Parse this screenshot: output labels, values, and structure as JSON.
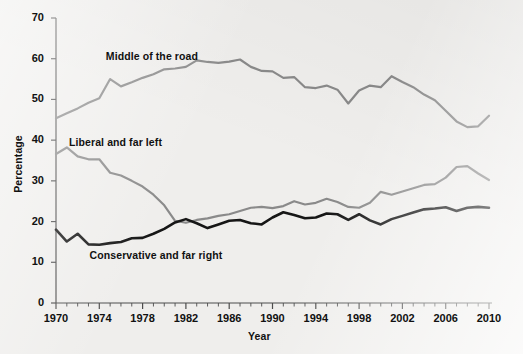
{
  "chart_data": {
    "type": "line",
    "title": "",
    "xlabel": "Year",
    "ylabel": "Percentage",
    "xlim": [
      1970,
      2010
    ],
    "ylim": [
      0,
      70
    ],
    "grid": false,
    "legend_position": "inline-annotations",
    "xticks": [
      1970,
      1974,
      1978,
      1982,
      1986,
      1990,
      1994,
      1998,
      2002,
      2006,
      2010
    ],
    "xtick_labels": [
      "1970",
      "1974",
      "1978",
      "1982",
      "1986",
      "1990",
      "1994",
      "1998",
      "2002",
      "2006",
      "2010"
    ],
    "yticks": [
      0,
      10,
      20,
      30,
      40,
      50,
      60,
      70
    ],
    "ytick_labels": [
      "0",
      "10",
      "20",
      "30",
      "40",
      "50",
      "60",
      "70"
    ],
    "x": [
      1970,
      1971,
      1972,
      1973,
      1974,
      1975,
      1976,
      1977,
      1978,
      1979,
      1980,
      1981,
      1982,
      1983,
      1984,
      1985,
      1986,
      1987,
      1988,
      1989,
      1990,
      1991,
      1992,
      1993,
      1994,
      1995,
      1996,
      1997,
      1998,
      1999,
      2000,
      2001,
      2002,
      2003,
      2004,
      2005,
      2006,
      2007,
      2008,
      2009,
      2010
    ],
    "series": [
      {
        "name": "Middle of the road",
        "color": "#8a8a8a",
        "label_x": 1974.6,
        "label_y": 60.5,
        "values": [
          45.4,
          46.6,
          47.8,
          49.2,
          50.3,
          55.0,
          53.2,
          54.2,
          55.3,
          56.2,
          57.4,
          57.6,
          58.0,
          59.6,
          59.2,
          59.0,
          59.3,
          59.8,
          58.0,
          57.0,
          56.9,
          55.3,
          55.5,
          53.0,
          52.8,
          53.4,
          52.4,
          49.0,
          52.2,
          53.4,
          53.0,
          55.7,
          54.3,
          53.0,
          51.2,
          49.8,
          47.2,
          44.6,
          43.2,
          43.4,
          46.0
        ]
      },
      {
        "name": "Liberal and far left",
        "color": "#8a8a8a",
        "label_x": 1971.2,
        "label_y": 39.4,
        "values": [
          36.6,
          38.2,
          36.0,
          35.3,
          35.3,
          32.0,
          31.3,
          30.0,
          28.6,
          26.6,
          24.0,
          20.2,
          19.7,
          20.4,
          20.8,
          21.4,
          21.8,
          22.6,
          23.4,
          23.6,
          23.3,
          23.8,
          25.0,
          24.2,
          24.6,
          25.6,
          24.8,
          23.6,
          23.4,
          24.6,
          27.3,
          26.6,
          27.4,
          28.2,
          29.0,
          29.2,
          30.8,
          33.4,
          33.6,
          31.8,
          30.2
        ]
      },
      {
        "name": "Conservative and far right",
        "color": "#161616",
        "label_x": 1973.1,
        "label_y": 11.6,
        "values": [
          18.0,
          15.1,
          17.0,
          14.4,
          14.3,
          14.7,
          15.0,
          15.9,
          16.0,
          17.0,
          18.2,
          19.8,
          20.6,
          19.6,
          18.4,
          19.3,
          20.2,
          20.4,
          19.6,
          19.3,
          21.0,
          22.3,
          21.6,
          20.8,
          21.0,
          22.0,
          21.8,
          20.4,
          21.8,
          20.3,
          19.3,
          20.6,
          21.4,
          22.2,
          23.0,
          23.2,
          23.5,
          22.6,
          23.4,
          23.6,
          23.4
        ]
      }
    ]
  }
}
